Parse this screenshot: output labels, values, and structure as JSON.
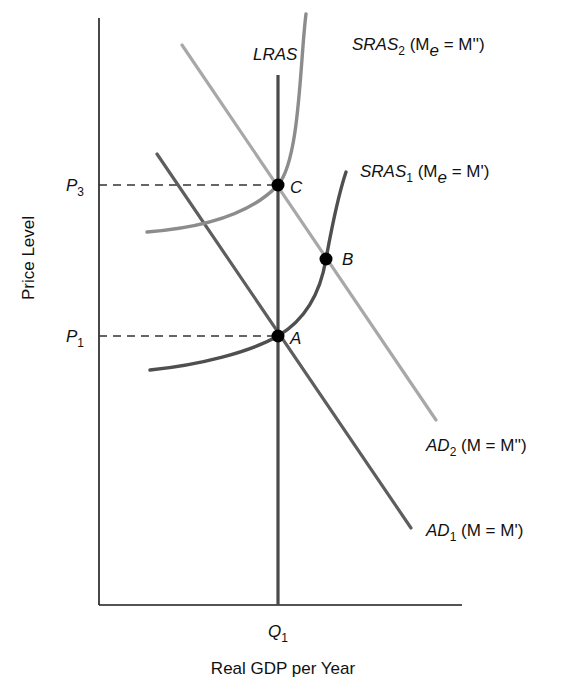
{
  "diagram": {
    "type": "AS-AD economics diagram",
    "y_axis_label": "Price Level",
    "x_axis_label": "Real GDP per Year",
    "x_tick": {
      "main": "Q",
      "sub": "1"
    },
    "y_ticks": [
      {
        "main": "P",
        "sub": "3"
      },
      {
        "main": "P",
        "sub": "1"
      }
    ],
    "curves": {
      "lras": {
        "label": "LRAS"
      },
      "sras2": {
        "main": "SRAS",
        "sub": "2",
        "paren_open": " (M",
        "paren_sub": "e",
        "paren_close": " = M'')"
      },
      "sras1": {
        "main": "SRAS",
        "sub": "1",
        "paren_open": " (M",
        "paren_sub": "e",
        "paren_close": " = M')"
      },
      "ad2": {
        "main": "AD",
        "sub": "2",
        "rest": " (M = M'')"
      },
      "ad1": {
        "main": "AD",
        "sub": "1",
        "rest": " (M = M')"
      }
    },
    "points": [
      {
        "label": "C"
      },
      {
        "label": "B"
      },
      {
        "label": "A"
      }
    ],
    "colors": {
      "axis": "#1a1a1a",
      "lras": "#4a4a4a",
      "ad1": "#5e5e5e",
      "ad2": "#a8a8a8",
      "sras1": "#4f4f4f",
      "sras2": "#8c8c8c",
      "dot": "#000000"
    }
  }
}
